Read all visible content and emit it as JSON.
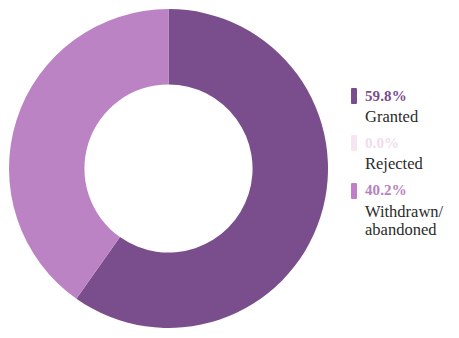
{
  "chart_data": {
    "type": "pie",
    "variant": "donut",
    "title": "",
    "subtitle": "",
    "xlabel": "",
    "ylabel": "",
    "legend_position": "right",
    "grid": false,
    "categories": [
      "Granted",
      "Rejected",
      "Withdrawn/abandoned"
    ],
    "values": [
      59.8,
      0.0,
      40.2
    ],
    "value_unit": "%",
    "value_labels": [
      "59.8%",
      "0.0%",
      "40.2%"
    ],
    "colors": [
      "#7a4d8c",
      "#f3e3f0",
      "#bc83c4"
    ],
    "start_angle_deg": 0,
    "direction": "clockwise",
    "inner_radius_ratio": 0.527,
    "series": [
      {
        "name": "Patent outcomes",
        "values": [
          59.8,
          0.0,
          40.2
        ]
      }
    ],
    "slices": [
      {
        "label": "Granted",
        "value": 59.8,
        "value_label": "59.8%",
        "color": "#7a4d8c",
        "start_angle_deg": 0,
        "end_angle_deg": 215.28
      },
      {
        "label": "Rejected",
        "value": 0.0,
        "value_label": "0.0%",
        "color": "#f3e3f0",
        "start_angle_deg": 215.28,
        "end_angle_deg": 215.28
      },
      {
        "label": "Withdrawn/abandoned",
        "value": 40.2,
        "value_label": "40.2%",
        "color": "#bc83c4",
        "start_angle_deg": 215.28,
        "end_angle_deg": 360
      }
    ]
  },
  "legend": {
    "entries": [
      {
        "value_label": "59.8%",
        "label_lines": [
          "Granted"
        ],
        "swatch_color": "#7a4d8c",
        "value_color": "#7a4d8c"
      },
      {
        "value_label": "0.0%",
        "label_lines": [
          "Rejected"
        ],
        "swatch_color": "#f6e6f2",
        "value_color": "#f0dced"
      },
      {
        "value_label": "40.2%",
        "label_lines": [
          "Withdrawn/",
          "abandoned"
        ],
        "swatch_color": "#c07fc8",
        "value_color": "#b97ec0"
      }
    ]
  }
}
